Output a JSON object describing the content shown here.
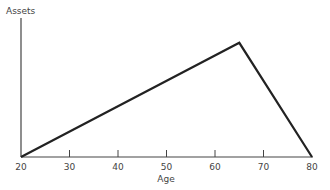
{
  "chart_data": {
    "type": "line",
    "title": "",
    "xlabel": "Age",
    "ylabel": "Assets",
    "x": [
      20,
      65,
      80
    ],
    "series": [
      {
        "name": "Assets",
        "values": [
          0,
          1,
          0
        ]
      }
    ],
    "x_ticks": [
      "20",
      "30",
      "40",
      "50",
      "60",
      "70",
      "80"
    ],
    "xlim": [
      20,
      80
    ],
    "ylim": [
      0,
      1.2
    ],
    "y_ticks": [],
    "grid": false,
    "legend": null,
    "annotations": []
  },
  "labels": {
    "y_axis": "Assets",
    "x_axis": "Age"
  }
}
